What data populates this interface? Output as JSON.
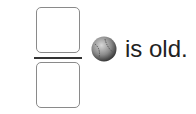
{
  "fraction": {
    "numerator": "",
    "denominator": ""
  },
  "icon": "baseball-icon",
  "sentence": "is old."
}
